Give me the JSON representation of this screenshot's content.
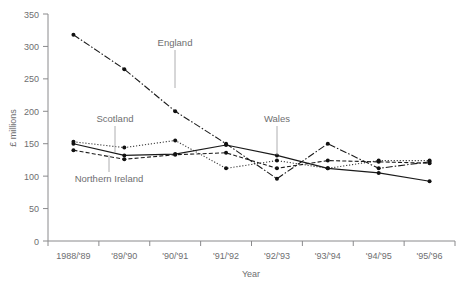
{
  "chart_data": {
    "type": "line",
    "title": "",
    "xlabel": "Year",
    "ylabel": "£ millions",
    "categories": [
      "1988/'89",
      "'89/'90",
      "'90/'91",
      "'91/'92",
      "'92/'93",
      "'93/'94",
      "'94/'95",
      "'95/'96"
    ],
    "ylim": [
      0,
      350
    ],
    "yticks": [
      0,
      50,
      100,
      150,
      200,
      250,
      300,
      350
    ],
    "ytick_labels": [
      "0",
      "50",
      "100",
      "150",
      "200",
      "250",
      "300",
      "350"
    ],
    "grid": false,
    "legend_position": "inline-annotations",
    "series": [
      {
        "name": "England",
        "line_style": "dash-dot",
        "color": "#1a1a1a",
        "values": [
          318,
          265,
          200,
          150,
          96,
          150,
          112,
          122
        ]
      },
      {
        "name": "Scotland",
        "line_style": "dotted",
        "color": "#3c3c3c",
        "values": [
          153,
          144,
          155,
          112,
          124,
          112,
          124,
          124
        ]
      },
      {
        "name": "Wales",
        "line_style": "solid",
        "color": "#1a1a1a",
        "values": [
          150,
          132,
          134,
          148,
          132,
          112,
          105,
          92
        ]
      },
      {
        "name": "Northern Ireland",
        "line_style": "dashed",
        "color": "#1a1a1a",
        "values": [
          140,
          126,
          133,
          136,
          112,
          124,
          122,
          120
        ]
      }
    ],
    "annotations": [
      {
        "label": "England",
        "series": "England"
      },
      {
        "label": "Scotland",
        "series": "Scotland"
      },
      {
        "label": "Wales",
        "series": "Wales"
      },
      {
        "label": "Northern Ireland",
        "series": "Northern Ireland"
      }
    ]
  },
  "axes": {
    "y_title": "£ millions",
    "x_title": "Year"
  }
}
